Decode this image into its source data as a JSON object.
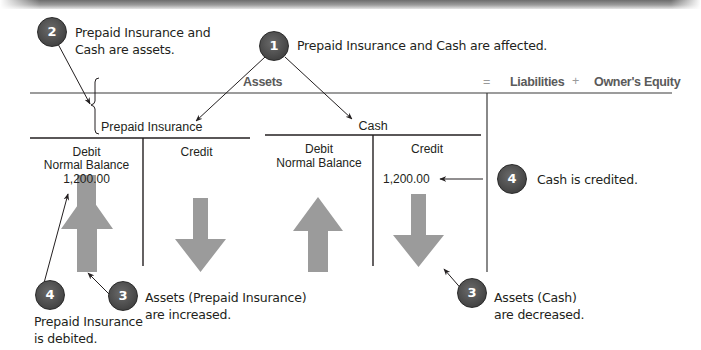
{
  "equation": {
    "assets_label": "Assets",
    "equals_sign": "=",
    "liabilities_label": "Liabilities",
    "plus_sign": "+",
    "owners_equity_label": "Owner's Equity"
  },
  "accounts": [
    {
      "name": "Prepaid Insurance",
      "debit_label": "Debit",
      "debit_note": "Normal Balance",
      "debit_value": "1,200.00",
      "credit_label": "Credit",
      "credit_value": ""
    },
    {
      "name": "Cash",
      "debit_label": "Debit",
      "debit_note": "Normal Balance",
      "debit_value": "",
      "credit_label": "Credit",
      "credit_value": "1,200.00"
    }
  ],
  "callouts": [
    {
      "number": "2",
      "lines": [
        "Prepaid Insurance and",
        "Cash are assets."
      ]
    },
    {
      "number": "1",
      "lines": [
        "Prepaid Insurance and Cash are affected."
      ]
    },
    {
      "number": "4",
      "lines": [
        "Cash is credited."
      ]
    },
    {
      "number": "4",
      "lines": [
        "Prepaid Insurance",
        "is debited."
      ]
    },
    {
      "number": "3",
      "lines": [
        "Assets (Prepaid Insurance)",
        "are increased."
      ]
    },
    {
      "number": "3",
      "lines": [
        "Assets (Cash)",
        "are decreased."
      ]
    }
  ],
  "colors": {
    "badge_fill": "#4a4a4a",
    "arrow_fill": "#9b9b9b",
    "line": "#231f20",
    "header_text": "#5a5a5a"
  }
}
